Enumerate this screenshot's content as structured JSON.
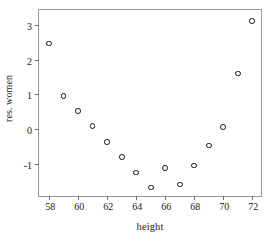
{
  "chart_data": {
    "type": "scatter",
    "title": "",
    "xlabel": "height",
    "ylabel": "res. women",
    "x": [
      58,
      59,
      60,
      61,
      62,
      63,
      64,
      65,
      66,
      67,
      68,
      69,
      70,
      71,
      72
    ],
    "values": [
      2.46,
      0.96,
      0.52,
      0.08,
      -0.38,
      -0.8,
      -1.25,
      -1.68,
      -1.13,
      -1.6,
      -1.05,
      -0.47,
      0.06,
      1.6,
      3.12
    ],
    "series": [
      {
        "name": "res. women",
        "points": [
          {
            "x": 58,
            "y": 2.46
          },
          {
            "x": 59,
            "y": 0.96
          },
          {
            "x": 60,
            "y": 0.52
          },
          {
            "x": 61,
            "y": 0.08
          },
          {
            "x": 62,
            "y": -0.38
          },
          {
            "x": 63,
            "y": -0.8
          },
          {
            "x": 64,
            "y": -1.25
          },
          {
            "x": 65,
            "y": -1.68
          },
          {
            "x": 66,
            "y": -1.13
          },
          {
            "x": 67,
            "y": -1.6
          },
          {
            "x": 68,
            "y": -1.05
          },
          {
            "x": 69,
            "y": -0.47
          },
          {
            "x": 70,
            "y": 0.06
          },
          {
            "x": 71,
            "y": 1.6
          },
          {
            "x": 72,
            "y": 3.12
          }
        ]
      }
    ],
    "xlim": [
      57.3,
      72.6
    ],
    "ylim": [
      -1.93,
      3.43
    ],
    "xticks": [
      58,
      60,
      62,
      64,
      66,
      68,
      70,
      72
    ],
    "xtick_labels": [
      "58",
      "60",
      "62",
      "64",
      "66",
      "68",
      "70",
      "72"
    ],
    "yticks": [
      -1,
      0,
      1,
      2,
      3
    ],
    "ytick_labels": [
      "-1",
      "0",
      "1",
      "2",
      "3"
    ],
    "grid": false,
    "legend": false,
    "marker": "open-circle",
    "marker_color": "#111111",
    "frame_color": "#9a9a9a",
    "background_color": "#ffffff"
  }
}
